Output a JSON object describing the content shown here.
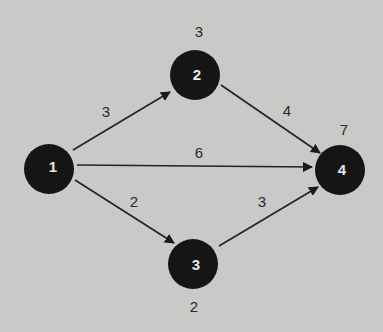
{
  "diagram": {
    "type": "directed-network",
    "nodes": [
      {
        "id": "1",
        "label": "1",
        "time": ""
      },
      {
        "id": "2",
        "label": "2",
        "time": "3"
      },
      {
        "id": "3",
        "label": "3",
        "time": "2"
      },
      {
        "id": "4",
        "label": "4",
        "time": "7"
      }
    ],
    "edges": [
      {
        "from": "1",
        "to": "2",
        "weight": "3"
      },
      {
        "from": "1",
        "to": "4",
        "weight": "6"
      },
      {
        "from": "1",
        "to": "3",
        "weight": "2"
      },
      {
        "from": "2",
        "to": "4",
        "weight": "4"
      },
      {
        "from": "3",
        "to": "4",
        "weight": "3"
      }
    ],
    "colors": {
      "background": "#c9c9c7",
      "node": "#151515",
      "edge": "#222222",
      "node_text": "#e8e8e8"
    }
  }
}
